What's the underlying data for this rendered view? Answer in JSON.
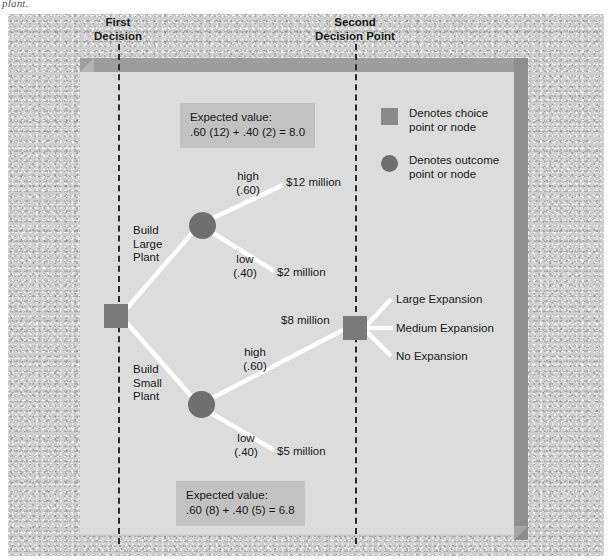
{
  "caption_fragment": "plant.",
  "headers": {
    "first": "First\nDecision",
    "second": "Second\nDecision Point"
  },
  "legend": {
    "items": [
      {
        "shape": "square",
        "label": "Denotes choice\npoint or node"
      },
      {
        "shape": "circle",
        "label": "Denotes outcome\npoint or node"
      }
    ]
  },
  "expected_values": {
    "top": {
      "title": "Expected value:",
      "formula": ".60 (12) + .40 (2) = 8.0"
    },
    "bottom": {
      "title": "Expected value:",
      "formula": ".60 (8) + .40 (5) = 6.8"
    }
  },
  "decisions": {
    "build_large": "Build\nLarge\nPlant",
    "build_small": "Build\nSmall\nPlant"
  },
  "outcomes": {
    "large_high_label": "high",
    "large_high_prob": "(.60)",
    "large_high_payoff": "$12 million",
    "large_low_label": "low",
    "large_low_prob": "(.40)",
    "large_low_payoff": "$2 million",
    "small_high_label": "high",
    "small_high_prob": "(.60)",
    "small_high_payoff": "$8 million",
    "small_low_label": "low",
    "small_low_prob": "(.40)",
    "small_low_payoff": "$5 million"
  },
  "second_decision_options": [
    "Large Expansion",
    "Medium Expansion",
    "No Expansion"
  ],
  "colors": {
    "board": "#cfcfcf",
    "panel": "#dcdcdc",
    "slab_top": "#9d9d9d",
    "slab_side": "#8e8e8e",
    "node": "#7a7a7a",
    "callout": "#c2c2c2",
    "branch": "#ffffff",
    "guide": "#2b2b2b"
  }
}
